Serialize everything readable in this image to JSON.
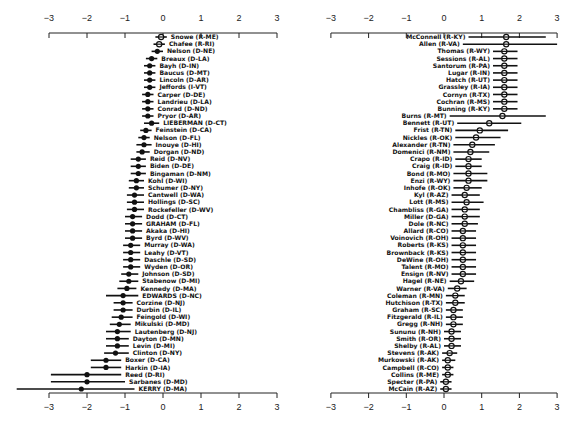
{
  "chart_data": [
    {
      "type": "scatter",
      "subtype": "dot-and-interval (point estimates with confidence intervals)",
      "panel": "left",
      "title": "",
      "xlabel": "",
      "ylabel": "",
      "xlim": [
        -3,
        3
      ],
      "xticks": [
        -3,
        -2,
        -1,
        0,
        1,
        2,
        3
      ],
      "grid": false,
      "axes": "top and bottom",
      "points": [
        {
          "label": "Snowe (R-ME)",
          "x": -0.05,
          "lo": -0.2,
          "hi": 0.1
        },
        {
          "label": "Chafee (R-RI)",
          "x": -0.1,
          "lo": -0.25,
          "hi": 0.05
        },
        {
          "label": "Nelson (D-NE)",
          "x": -0.15,
          "lo": -0.3,
          "hi": 0.0
        },
        {
          "label": "Breaux (D-LA)",
          "x": -0.3,
          "lo": -0.45,
          "hi": -0.15
        },
        {
          "label": "Bayh (D-IN)",
          "x": -0.35,
          "lo": -0.5,
          "hi": -0.2
        },
        {
          "label": "Baucus (D-MT)",
          "x": -0.35,
          "lo": -0.5,
          "hi": -0.2
        },
        {
          "label": "Lincoln (D-AR)",
          "x": -0.35,
          "lo": -0.5,
          "hi": -0.2
        },
        {
          "label": "Jeffords (I-VT)",
          "x": -0.35,
          "lo": -0.5,
          "hi": -0.2
        },
        {
          "label": "Carper (D-DE)",
          "x": -0.4,
          "lo": -0.55,
          "hi": -0.25
        },
        {
          "label": "Landrieu (D-LA)",
          "x": -0.4,
          "lo": -0.55,
          "hi": -0.25
        },
        {
          "label": "Conrad (D-ND)",
          "x": -0.4,
          "lo": -0.55,
          "hi": -0.25
        },
        {
          "label": "Pryor (D-AR)",
          "x": -0.4,
          "lo": -0.55,
          "hi": -0.25
        },
        {
          "label": "LIEBERMAN (D-CT)",
          "x": -0.3,
          "lo": -0.5,
          "hi": -0.1
        },
        {
          "label": "Feinstein (D-CA)",
          "x": -0.45,
          "lo": -0.6,
          "hi": -0.3
        },
        {
          "label": "Nelson (D-FL)",
          "x": -0.5,
          "lo": -0.65,
          "hi": -0.35
        },
        {
          "label": "Inouye (D-HI)",
          "x": -0.5,
          "lo": -0.7,
          "hi": -0.3
        },
        {
          "label": "Dorgan (D-ND)",
          "x": -0.55,
          "lo": -0.7,
          "hi": -0.35
        },
        {
          "label": "Reid (D-NV)",
          "x": -0.65,
          "lo": -0.85,
          "hi": -0.45
        },
        {
          "label": "Biden (D-DE)",
          "x": -0.65,
          "lo": -0.85,
          "hi": -0.45
        },
        {
          "label": "Bingaman (D-NM)",
          "x": -0.65,
          "lo": -0.85,
          "hi": -0.45
        },
        {
          "label": "Kohl (D-WI)",
          "x": -0.7,
          "lo": -0.9,
          "hi": -0.5
        },
        {
          "label": "Schumer (D-NY)",
          "x": -0.7,
          "lo": -0.9,
          "hi": -0.5
        },
        {
          "label": "Cantwell (D-WA)",
          "x": -0.75,
          "lo": -0.95,
          "hi": -0.5
        },
        {
          "label": "Hollings (D-SC)",
          "x": -0.75,
          "lo": -0.95,
          "hi": -0.5
        },
        {
          "label": "Rockefeller (D-WV)",
          "x": -0.75,
          "lo": -0.95,
          "hi": -0.5
        },
        {
          "label": "Dodd (D-CT)",
          "x": -0.8,
          "lo": -1.0,
          "hi": -0.55
        },
        {
          "label": "GRAHAM (D-FL)",
          "x": -0.8,
          "lo": -1.0,
          "hi": -0.55
        },
        {
          "label": "Akaka (D-HI)",
          "x": -0.8,
          "lo": -1.0,
          "hi": -0.55
        },
        {
          "label": "Byrd (D-WV)",
          "x": -0.8,
          "lo": -1.0,
          "hi": -0.55
        },
        {
          "label": "Murray (D-WA)",
          "x": -0.85,
          "lo": -1.05,
          "hi": -0.6
        },
        {
          "label": "Leahy (D-VT)",
          "x": -0.85,
          "lo": -1.05,
          "hi": -0.6
        },
        {
          "label": "Daschle (D-SD)",
          "x": -0.85,
          "lo": -1.05,
          "hi": -0.6
        },
        {
          "label": "Wyden (D-OR)",
          "x": -0.85,
          "lo": -1.05,
          "hi": -0.6
        },
        {
          "label": "Johnson (D-SD)",
          "x": -0.9,
          "lo": -1.1,
          "hi": -0.65
        },
        {
          "label": "Stabenow (D-MI)",
          "x": -0.9,
          "lo": -1.15,
          "hi": -0.65
        },
        {
          "label": "Kennedy (D-MA)",
          "x": -0.95,
          "lo": -1.2,
          "hi": -0.7
        },
        {
          "label": "EDWARDS (D-NC)",
          "x": -1.05,
          "lo": -1.5,
          "hi": -0.65
        },
        {
          "label": "Corzine (D-NJ)",
          "x": -1.05,
          "lo": -1.3,
          "hi": -0.8
        },
        {
          "label": "Durbin (D-IL)",
          "x": -1.05,
          "lo": -1.3,
          "hi": -0.8
        },
        {
          "label": "Feingold (D-WI)",
          "x": -1.1,
          "lo": -1.35,
          "hi": -0.8
        },
        {
          "label": "Mikulski (D-MD)",
          "x": -1.15,
          "lo": -1.4,
          "hi": -0.85
        },
        {
          "label": "Lautenberg (D-NJ)",
          "x": -1.2,
          "lo": -1.5,
          "hi": -0.85
        },
        {
          "label": "Dayton (D-MN)",
          "x": -1.2,
          "lo": -1.5,
          "hi": -0.9
        },
        {
          "label": "Levin (D-MI)",
          "x": -1.2,
          "lo": -1.5,
          "hi": -0.9
        },
        {
          "label": "Clinton (D-NY)",
          "x": -1.25,
          "lo": -1.55,
          "hi": -0.9
        },
        {
          "label": "Boxer (D-CA)",
          "x": -1.5,
          "lo": -1.9,
          "hi": -1.1
        },
        {
          "label": "Harkin (D-IA)",
          "x": -1.5,
          "lo": -1.9,
          "hi": -1.1
        },
        {
          "label": "Reed (D-RI)",
          "x": -2.0,
          "lo": -2.95,
          "hi": -1.1
        },
        {
          "label": "Sarbanes (D-MD)",
          "x": -2.0,
          "lo": -2.95,
          "hi": -1.0
        },
        {
          "label": "KERRY (D-MA)",
          "x": -2.15,
          "lo": -3.85,
          "hi": -0.75
        }
      ]
    },
    {
      "type": "scatter",
      "subtype": "dot-and-interval (point estimates with confidence intervals)",
      "panel": "right",
      "title": "",
      "xlabel": "",
      "ylabel": "",
      "xlim": [
        -3,
        3
      ],
      "xticks": [
        -3,
        -2,
        -1,
        0,
        1,
        2,
        3
      ],
      "grid": false,
      "axes": "top and bottom",
      "points": [
        {
          "label": "McConnell (R-KY)",
          "x": 1.65,
          "lo": 0.65,
          "hi": 2.7
        },
        {
          "label": "Allen (R-VA)",
          "x": 1.65,
          "lo": 0.5,
          "hi": 3.0
        },
        {
          "label": "Thomas (R-WY)",
          "x": 1.6,
          "lo": 1.3,
          "hi": 1.95
        },
        {
          "label": "Sessions (R-AL)",
          "x": 1.6,
          "lo": 1.3,
          "hi": 1.95
        },
        {
          "label": "Santorum (R-PA)",
          "x": 1.6,
          "lo": 1.3,
          "hi": 1.95
        },
        {
          "label": "Lugar (R-IN)",
          "x": 1.6,
          "lo": 1.3,
          "hi": 1.95
        },
        {
          "label": "Hatch (R-UT)",
          "x": 1.6,
          "lo": 1.3,
          "hi": 1.95
        },
        {
          "label": "Grassley (R-IA)",
          "x": 1.6,
          "lo": 1.3,
          "hi": 1.95
        },
        {
          "label": "Cornyn (R-TX)",
          "x": 1.6,
          "lo": 1.3,
          "hi": 1.95
        },
        {
          "label": "Cochran (R-MS)",
          "x": 1.6,
          "lo": 1.3,
          "hi": 1.95
        },
        {
          "label": "Bunning (R-KY)",
          "x": 1.6,
          "lo": 1.3,
          "hi": 1.95
        },
        {
          "label": "Burns (R-MT)",
          "x": 1.55,
          "lo": 0.15,
          "hi": 2.7
        },
        {
          "label": "Bennett (R-UT)",
          "x": 1.2,
          "lo": 0.35,
          "hi": 2.05
        },
        {
          "label": "Frist (R-TN)",
          "x": 0.95,
          "lo": 0.3,
          "hi": 1.7
        },
        {
          "label": "Nickles (R-OK)",
          "x": 0.85,
          "lo": 0.3,
          "hi": 1.5
        },
        {
          "label": "Alexander (R-TN)",
          "x": 0.75,
          "lo": 0.25,
          "hi": 1.35
        },
        {
          "label": "Domenici (R-NM)",
          "x": 0.7,
          "lo": 0.25,
          "hi": 1.2
        },
        {
          "label": "Crapo (R-ID)",
          "x": 0.65,
          "lo": 0.3,
          "hi": 1.0
        },
        {
          "label": "Craig (R-ID)",
          "x": 0.65,
          "lo": 0.3,
          "hi": 1.0
        },
        {
          "label": "Bond (R-MO)",
          "x": 0.65,
          "lo": 0.25,
          "hi": 1.15
        },
        {
          "label": "Enzi (R-WY)",
          "x": 0.65,
          "lo": 0.25,
          "hi": 1.15
        },
        {
          "label": "Inhofe (R-OK)",
          "x": 0.6,
          "lo": 0.25,
          "hi": 1.0
        },
        {
          "label": "Kyl (R-AZ)",
          "x": 0.55,
          "lo": 0.2,
          "hi": 0.95
        },
        {
          "label": "Lott (R-MS)",
          "x": 0.6,
          "lo": 0.2,
          "hi": 1.05
        },
        {
          "label": "Chambliss (R-GA)",
          "x": 0.55,
          "lo": 0.2,
          "hi": 0.95
        },
        {
          "label": "Miller (D-GA)",
          "x": 0.55,
          "lo": 0.2,
          "hi": 0.95
        },
        {
          "label": "Dole (R-NC)",
          "x": 0.55,
          "lo": 0.2,
          "hi": 0.9
        },
        {
          "label": "Allard (R-CO)",
          "x": 0.5,
          "lo": 0.2,
          "hi": 0.85
        },
        {
          "label": "Voinovich (R-OH)",
          "x": 0.5,
          "lo": 0.2,
          "hi": 0.85
        },
        {
          "label": "Roberts (R-KS)",
          "x": 0.5,
          "lo": 0.2,
          "hi": 0.85
        },
        {
          "label": "Brownback (R-KS)",
          "x": 0.5,
          "lo": 0.2,
          "hi": 0.85
        },
        {
          "label": "DeWine (R-OH)",
          "x": 0.5,
          "lo": 0.2,
          "hi": 0.85
        },
        {
          "label": "Talent (R-MO)",
          "x": 0.5,
          "lo": 0.2,
          "hi": 0.85
        },
        {
          "label": "Ensign (R-NV)",
          "x": 0.5,
          "lo": 0.2,
          "hi": 0.85
        },
        {
          "label": "Hagel (R-NE)",
          "x": 0.45,
          "lo": 0.15,
          "hi": 0.8
        },
        {
          "label": "Warner (R-VA)",
          "x": 0.35,
          "lo": 0.1,
          "hi": 0.6
        },
        {
          "label": "Coleman (R-MN)",
          "x": 0.3,
          "lo": 0.05,
          "hi": 0.55
        },
        {
          "label": "Hutchison (R-TX)",
          "x": 0.3,
          "lo": 0.05,
          "hi": 0.55
        },
        {
          "label": "Graham (R-SC)",
          "x": 0.25,
          "lo": 0.05,
          "hi": 0.5
        },
        {
          "label": "Fitzgerald (R-IL)",
          "x": 0.25,
          "lo": 0.05,
          "hi": 0.5
        },
        {
          "label": "Gregg (R-NH)",
          "x": 0.25,
          "lo": 0.05,
          "hi": 0.5
        },
        {
          "label": "Sununu (R-NH)",
          "x": 0.2,
          "lo": 0.0,
          "hi": 0.45
        },
        {
          "label": "Smith (R-OR)",
          "x": 0.2,
          "lo": 0.0,
          "hi": 0.45
        },
        {
          "label": "Shelby (R-AL)",
          "x": 0.2,
          "lo": 0.0,
          "hi": 0.45
        },
        {
          "label": "Stevens (R-AK)",
          "x": 0.15,
          "lo": -0.05,
          "hi": 0.35
        },
        {
          "label": "Murkowski (R-AK)",
          "x": 0.1,
          "lo": -0.05,
          "hi": 0.3
        },
        {
          "label": "Campbell (R-CO)",
          "x": 0.1,
          "lo": -0.05,
          "hi": 0.25
        },
        {
          "label": "Collins (R-ME)",
          "x": 0.1,
          "lo": -0.05,
          "hi": 0.25
        },
        {
          "label": "Specter (R-PA)",
          "x": 0.05,
          "lo": -0.1,
          "hi": 0.2
        },
        {
          "label": "McCain (R-AZ)",
          "x": 0.05,
          "lo": -0.1,
          "hi": 0.2
        }
      ]
    }
  ],
  "axes": {
    "tick_labels": [
      "-3",
      "-2",
      "-1",
      "0",
      "1",
      "2",
      "3"
    ]
  }
}
